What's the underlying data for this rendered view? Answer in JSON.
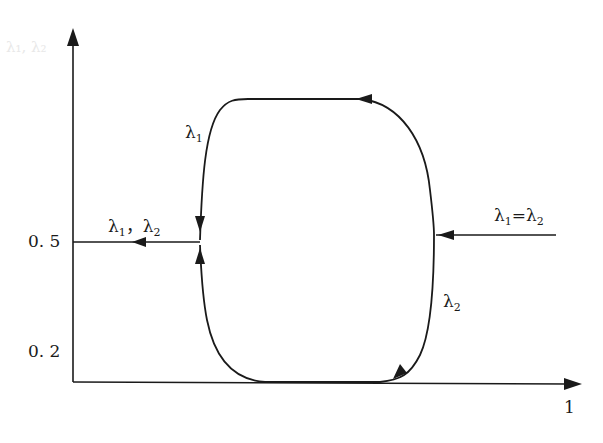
{
  "diagram": {
    "type": "phase-cycle",
    "axes": {
      "y_ticks": [
        "0. 5",
        "0. 2"
      ],
      "x_ticks": [
        "1"
      ],
      "y_axis_faint_label": "λ₁, λ₂"
    },
    "labels": {
      "left_top": {
        "sym": "λ",
        "sub": "1"
      },
      "left_branch": {
        "a": "λ",
        "a_sub": "1",
        "sep": "，",
        "b": "λ",
        "b_sub": "2"
      },
      "right_input": {
        "a": "λ",
        "a_sub": "1",
        "eq": "=",
        "b": "λ",
        "b_sub": "2"
      },
      "right_bottom": {
        "sym": "λ",
        "sub": "2"
      }
    },
    "colors": {
      "line": "#1a1a1a",
      "background": "#ffffff"
    }
  }
}
